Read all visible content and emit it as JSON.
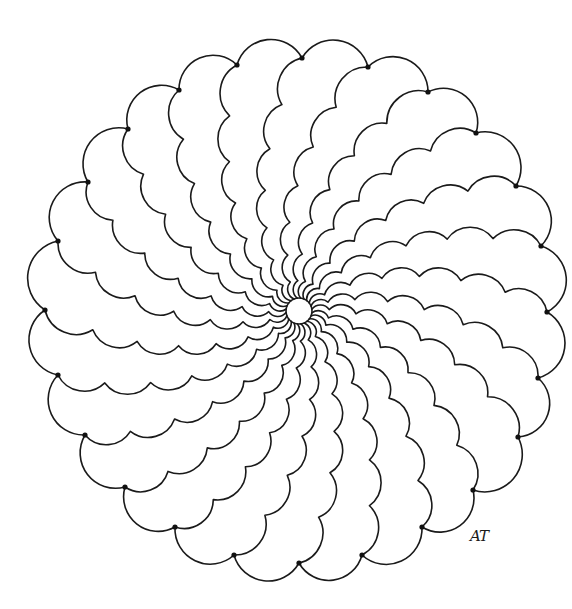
{
  "artwork": {
    "title": "Spiral scalloped mandala line drawing",
    "background": "#ffffff",
    "ink_color": "#1a1a1a",
    "center": {
      "x": 299,
      "y": 311,
      "hub_radius": 13
    },
    "arms": {
      "count": 24,
      "outer_radius": 252,
      "start_angle_deg": -90,
      "twist_deg": -38,
      "scallops_per_arm": 7,
      "growth_exponent": 1.35,
      "bump_ratio": 0.62
    },
    "rim_dots": [
      [
        302,
        58
      ],
      [
        368,
        67
      ],
      [
        428,
        92
      ],
      [
        476,
        133
      ],
      [
        516,
        186
      ],
      [
        541,
        246
      ],
      [
        547,
        312
      ],
      [
        538,
        378
      ],
      [
        518,
        437
      ],
      [
        473,
        490
      ],
      [
        422,
        527
      ],
      [
        362,
        555
      ],
      [
        299,
        563
      ],
      [
        234,
        555
      ],
      [
        175,
        527
      ],
      [
        125,
        487
      ],
      [
        85,
        435
      ],
      [
        58,
        375
      ],
      [
        45,
        310
      ],
      [
        58,
        241
      ],
      [
        88,
        182
      ],
      [
        128,
        129
      ],
      [
        179,
        90
      ],
      [
        237,
        65
      ]
    ],
    "signature": {
      "text": "AT",
      "x": 470,
      "y": 527
    }
  }
}
